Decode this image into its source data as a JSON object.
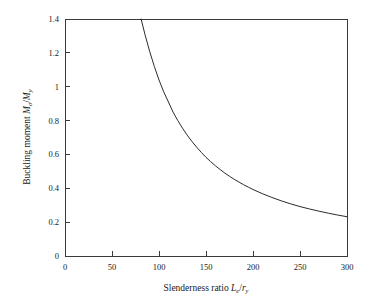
{
  "chart_data": {
    "type": "line",
    "title": "",
    "xlabel": "Slenderness ratio Le/ry",
    "ylabel": "Buckling moment Mo/My",
    "xlabel_parts": {
      "text_before": "Slenderness ratio ",
      "var1": "L",
      "var1_sub": "e",
      "divider": "/",
      "var2": "r",
      "var2_sub": "y"
    },
    "ylabel_parts": {
      "text_before": "Buckling moment ",
      "var1": "M",
      "var1_sub": "o",
      "divider": "/",
      "var2": "M",
      "var2_sub": "y"
    },
    "xlim": [
      0,
      300
    ],
    "ylim": [
      0,
      1.4
    ],
    "xticks": [
      0,
      50,
      100,
      150,
      200,
      250,
      300
    ],
    "yticks": [
      0,
      0.2,
      0.4,
      0.6,
      0.8,
      1,
      1.2,
      1.4
    ],
    "xtick_labels": [
      "0",
      "50",
      "100",
      "150",
      "200",
      "250",
      "300"
    ],
    "ytick_labels": [
      "0",
      "0.2",
      "0.4",
      "0.6",
      "0.8",
      "1",
      "1.2",
      "1.4"
    ],
    "grid": false,
    "legend": false,
    "series": [
      {
        "name": "Elastic buckling moment",
        "x": [
          81,
          85,
          90,
          95,
          100,
          105,
          110,
          115,
          120,
          125,
          130,
          135,
          140,
          145,
          150,
          155,
          160,
          165,
          170,
          175,
          180,
          185,
          190,
          195,
          200,
          210,
          220,
          230,
          240,
          250,
          260,
          270,
          280,
          290,
          300
        ],
        "y": [
          1.4,
          1.31,
          1.21,
          1.12,
          1.04,
          0.97,
          0.91,
          0.85,
          0.8,
          0.755,
          0.714,
          0.677,
          0.643,
          0.612,
          0.583,
          0.557,
          0.533,
          0.511,
          0.49,
          0.471,
          0.453,
          0.437,
          0.421,
          0.407,
          0.393,
          0.368,
          0.346,
          0.326,
          0.308,
          0.292,
          0.278,
          0.265,
          0.253,
          0.242,
          0.232
        ],
        "color": "#2b2b2b"
      }
    ]
  },
  "colors": {
    "background": "#ffffff",
    "axis": "#3a3a3a",
    "curve": "#2b2b2b",
    "text": "#1a1a1a"
  }
}
